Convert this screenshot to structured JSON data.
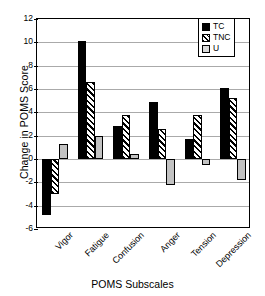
{
  "chart_data": {
    "type": "bar",
    "title": "",
    "xlabel": "POMS Subscales",
    "ylabel": "Change in POMS Score",
    "categories": [
      "Vigor",
      "Fatigue",
      "Confusion",
      "Anger",
      "Tension",
      "Depression"
    ],
    "series": [
      {
        "name": "TC",
        "values": [
          -4.8,
          10.1,
          2.85,
          4.85,
          1.7,
          6.1
        ]
      },
      {
        "name": "TNC",
        "values": [
          -3.0,
          6.6,
          3.8,
          2.6,
          3.75,
          5.25
        ]
      },
      {
        "name": "U",
        "values": [
          1.3,
          1.95,
          0.4,
          -2.25,
          -0.5,
          -1.8
        ]
      }
    ],
    "ylim": [
      -6,
      12
    ],
    "ytick_labels": [
      "12",
      "10",
      "8",
      "6",
      "4",
      "2",
      "0",
      "-2",
      "-4",
      "-6"
    ],
    "ytick_values": [
      12,
      10,
      8,
      6,
      4,
      2,
      0,
      -2,
      -4,
      -6
    ],
    "grid": true,
    "legend_position": "top-right",
    "legend": [
      "TC",
      "TNC",
      "U"
    ],
    "colors": {
      "TC": "#000000",
      "TNC": "#ffffff",
      "U": "#c2c2c2",
      "gridline": "#aaaaaa",
      "axis": "#000000",
      "background": "#ffffff"
    }
  }
}
